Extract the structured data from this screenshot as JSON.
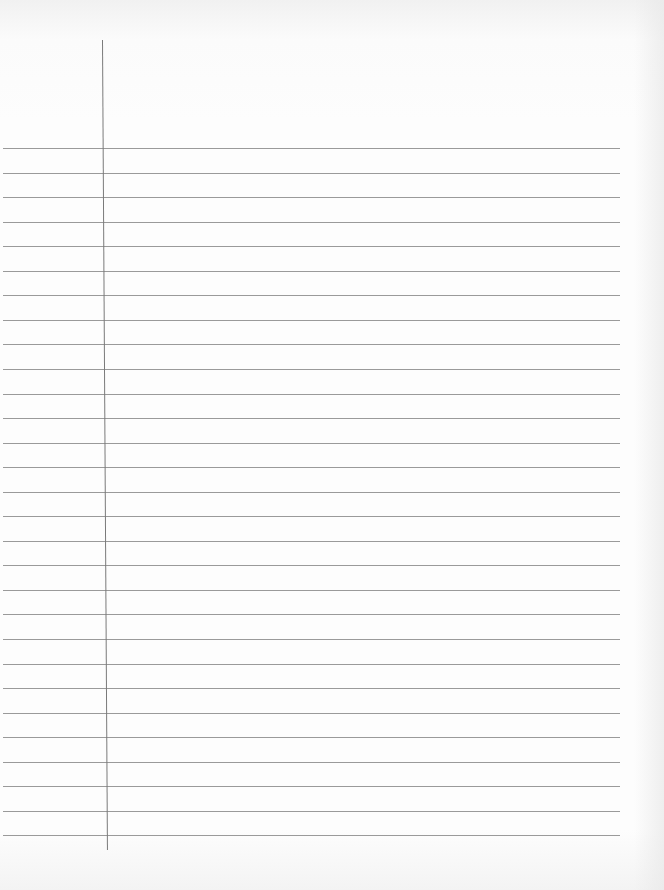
{
  "page": {
    "type": "lined-paper",
    "background_color": "#fdfdfd",
    "rule_color": "#9a9a9a",
    "margin_line_color": "#7a7a7a",
    "ruled_lines": {
      "count": 29,
      "first_y": 148,
      "spacing": 24.55,
      "left_x": 3,
      "right_x": 620
    },
    "margin_line": {
      "x": 102,
      "top_y": 40,
      "bottom_y": 850
    },
    "text_content": []
  }
}
